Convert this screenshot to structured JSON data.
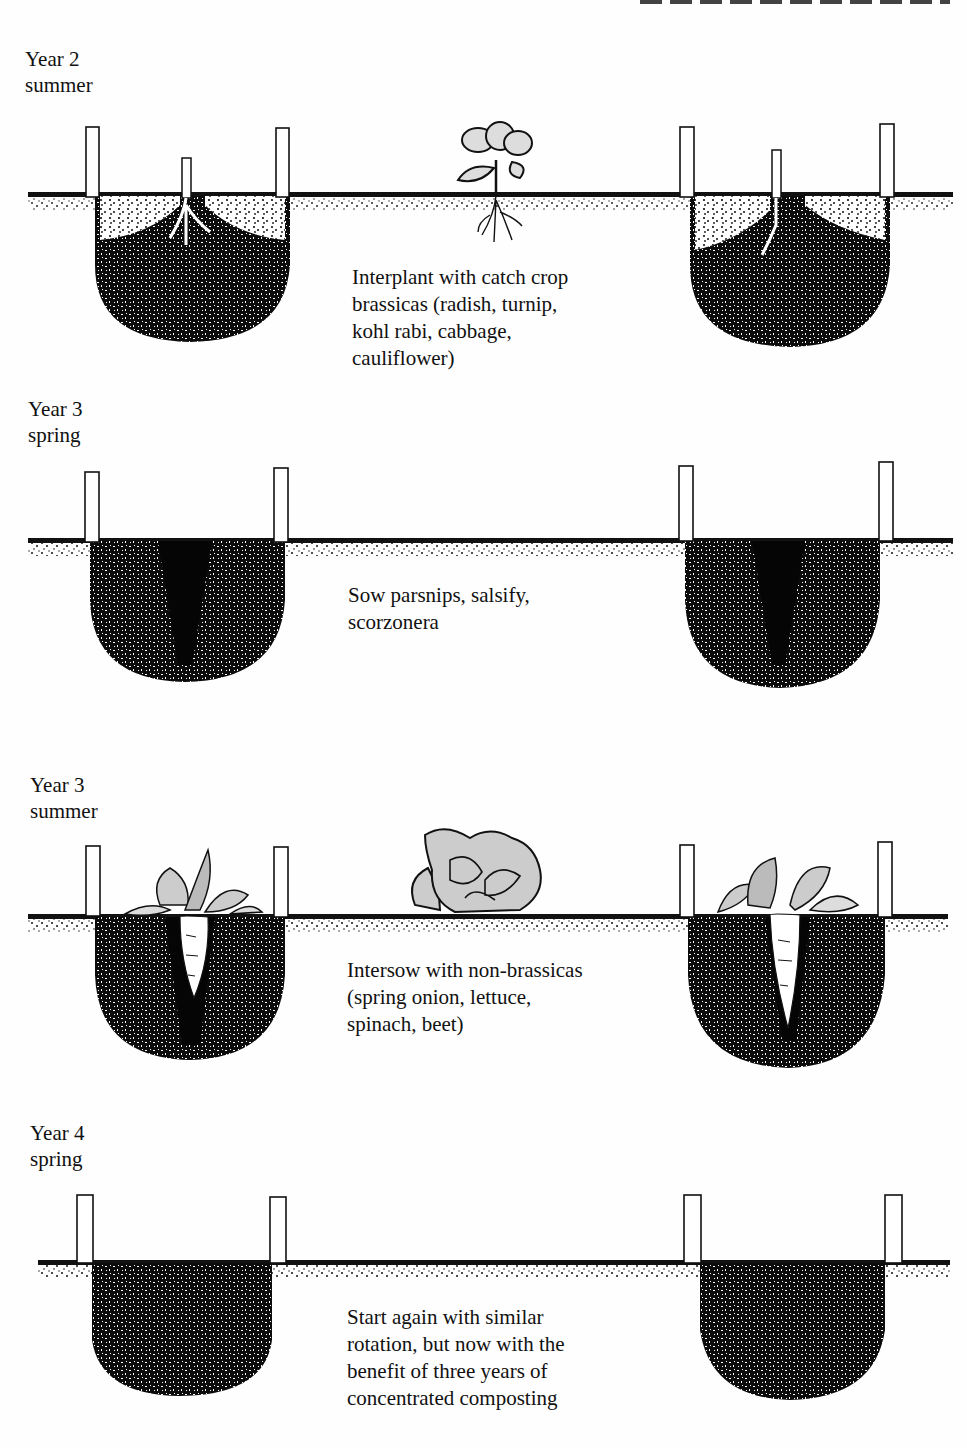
{
  "page": {
    "background": "#ffffff",
    "ink": "#111111"
  },
  "panels": [
    {
      "id": "year2-summer",
      "year": "Year 2",
      "season": "summer",
      "caption": "Interplant with catch crop\nbrassicas (radish, turnip,\nkohl rabi, cabbage,\ncauliflower)",
      "pits_contents": "comfrey-like root crop",
      "surface_plant": "brassica-seedling"
    },
    {
      "id": "year3-spring",
      "year": "Year 3",
      "season": "spring",
      "caption": "Sow parsnips, salsify,\nscorzonera",
      "pits_contents": "dark sowing channel",
      "surface_plant": null
    },
    {
      "id": "year3-summer",
      "year": "Year 3",
      "season": "summer",
      "caption": "Intersow with non-brassicas\n(spring onion, lettuce,\nspinach, beet)",
      "pits_contents": "parsnip root",
      "surface_plant": "lettuce"
    },
    {
      "id": "year4-spring",
      "year": "Year 4",
      "season": "spring",
      "caption": "Start again with similar\nrotation, but now with the\nbenefit of three years of\nconcentrated composting",
      "pits_contents": "full compost",
      "surface_plant": null
    }
  ]
}
